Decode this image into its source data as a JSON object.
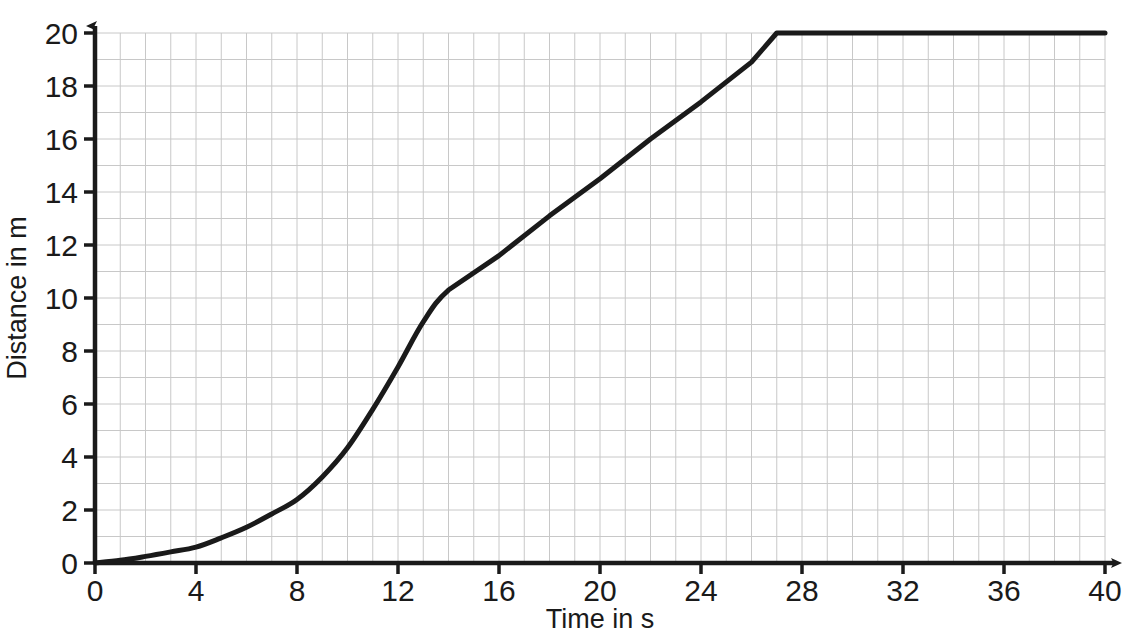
{
  "chart_data": {
    "type": "line",
    "title": "",
    "xlabel": "Time in s",
    "ylabel": "Distance in m",
    "xlim": [
      0,
      40
    ],
    "ylim": [
      0,
      20
    ],
    "xticks": [
      0,
      4,
      8,
      12,
      16,
      20,
      24,
      28,
      32,
      36,
      40
    ],
    "yticks": [
      0,
      2,
      4,
      6,
      8,
      10,
      12,
      14,
      16,
      18,
      20
    ],
    "xtick_labels": [
      "0",
      "4",
      "8",
      "12",
      "16",
      "20",
      "24",
      "28",
      "32",
      "36",
      "40"
    ],
    "ytick_labels": [
      "0",
      "2",
      "4",
      "6",
      "8",
      "10",
      "12",
      "14",
      "16",
      "18",
      "20"
    ],
    "grid": true,
    "grid_step_x": 1,
    "grid_step_y": 1,
    "grid_color": "#c8c8c8",
    "axis_color": "#1a1a1a",
    "line_color": "#1a1a1a",
    "line_width": 5,
    "legend": null,
    "series": [
      {
        "name": "Distance travelled",
        "x": [
          0,
          1,
          2,
          3,
          4,
          5,
          6,
          7,
          8,
          9,
          10,
          11,
          12,
          13,
          14,
          16,
          18,
          20,
          22,
          24,
          26,
          27,
          28,
          32,
          36,
          40
        ],
        "values": [
          0,
          0.1,
          0.25,
          0.42,
          0.6,
          0.95,
          1.35,
          1.85,
          2.4,
          3.25,
          4.35,
          5.8,
          7.4,
          9.1,
          10.3,
          11.6,
          13.1,
          14.5,
          16.0,
          17.4,
          18.9,
          20.0,
          20.0,
          20.0,
          20.0,
          20.0
        ]
      }
    ],
    "annotations": [
      {
        "label": "curve flattens to constant distance",
        "x": 27,
        "y": 20
      }
    ]
  },
  "axes": {
    "x_arrow": true,
    "y_arrow": true
  }
}
